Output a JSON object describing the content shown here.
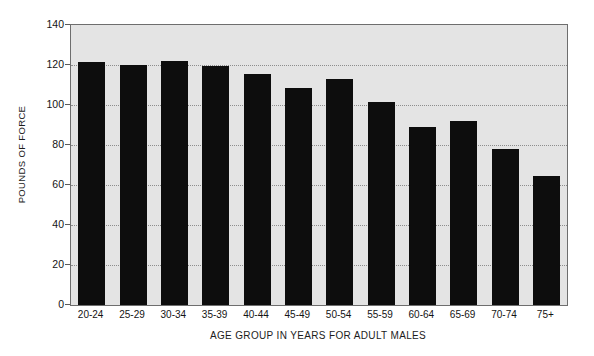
{
  "chart_data": {
    "type": "bar",
    "title": "",
    "xlabel": "AGE GROUP IN YEARS FOR ADULT MALES",
    "ylabel": "POUNDS OF FORCE",
    "categories": [
      "20-24",
      "25-29",
      "30-34",
      "35-39",
      "40-44",
      "45-49",
      "50-54",
      "55-59",
      "60-64",
      "65-69",
      "70-74",
      "75+"
    ],
    "values": [
      121.5,
      120,
      122,
      119.5,
      115.5,
      108.5,
      113,
      101.5,
      89,
      92,
      78,
      64.5
    ],
    "ylim": [
      0,
      140
    ],
    "xlim_categories": 12,
    "y_ticks": [
      0,
      20,
      40,
      60,
      80,
      100,
      120,
      140
    ],
    "grid": true,
    "grid_axis": "y",
    "grid_style": "dotted",
    "legend": null,
    "legend_position": "none",
    "colors": {
      "bar": "#0d0d0d",
      "plot_background": "#e4e4e4",
      "figure_background": "#ffffff",
      "gridline": "#8d8d8d",
      "axis_border": "#6e6e6e",
      "text": "#141414"
    }
  }
}
